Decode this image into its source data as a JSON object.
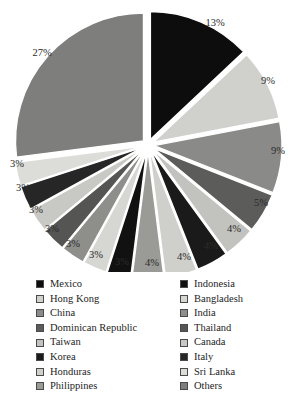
{
  "chart_data": {
    "type": "pie",
    "title": "",
    "subtitle": "",
    "xlabel": "",
    "ylabel": "",
    "grid": false,
    "legend_position": "bottom",
    "exploded": true,
    "start_angle_deg": -90,
    "center": {
      "x": 148,
      "y": 145
    },
    "radius": 128,
    "categories": [
      "Mexico",
      "Hong Kong",
      "China",
      "Dominican Republic",
      "Taiwan",
      "Korea",
      "Honduras",
      "Philippines",
      "Indonesia",
      "Bangladesh",
      "India",
      "Thailand",
      "Canada",
      "Italy",
      "Sri Lanka",
      "Others"
    ],
    "values": [
      13,
      9,
      9,
      5,
      4,
      4,
      4,
      4,
      3,
      3,
      3,
      3,
      3,
      3,
      3,
      27
    ],
    "value_labels": [
      "13%",
      "9%",
      "9%",
      "5%",
      "4%",
      "4%",
      "4%",
      "4%",
      "3%",
      "3%",
      "3%",
      "3%",
      "3%",
      "3%",
      "3%",
      "27%"
    ],
    "colors": [
      "#0d0d0d",
      "#d0d0cc",
      "#8a8a88",
      "#5c5c5a",
      "#c2c2be",
      "#1a1a1a",
      "#cfcfcb",
      "#9a9a97",
      "#111111",
      "#d6d6d2",
      "#8e8e8b",
      "#555553",
      "#c8c8c4",
      "#262626",
      "#dcdcd8",
      "#7e7e7c"
    ],
    "slices": [
      {
        "label": "Mexico",
        "value": 13,
        "value_label": "13%",
        "color": "#0d0d0d",
        "label_x": 215,
        "label_y": 22
      },
      {
        "label": "Hong Kong",
        "value": 9,
        "value_label": "9%",
        "color": "#d0d0cc",
        "label_x": 268,
        "label_y": 80
      },
      {
        "label": "China",
        "value": 9,
        "value_label": "9%",
        "color": "#8a8a88",
        "label_x": 278,
        "label_y": 150
      },
      {
        "label": "Dominican Republic",
        "value": 5,
        "value_label": "5%",
        "color": "#5c5c5a",
        "label_x": 261,
        "label_y": 202
      },
      {
        "label": "Taiwan",
        "value": 4,
        "value_label": "4%",
        "color": "#c2c2be",
        "label_x": 234,
        "label_y": 228
      },
      {
        "label": "Korea",
        "value": 4,
        "value_label": "4%",
        "color": "#1a1a1a",
        "label_x": 211,
        "label_y": 245
      },
      {
        "label": "Honduras",
        "value": 4,
        "value_label": "4%",
        "color": "#cfcfcb",
        "label_x": 184,
        "label_y": 256
      },
      {
        "label": "Philippines",
        "value": 4,
        "value_label": "4%",
        "color": "#9a9a97",
        "label_x": 152,
        "label_y": 262
      },
      {
        "label": "Indonesia",
        "value": 3,
        "value_label": "3%",
        "color": "#111111",
        "label_x": 122,
        "label_y": 261
      },
      {
        "label": "Bangladesh",
        "value": 3,
        "value_label": "3%",
        "color": "#d6d6d2",
        "label_x": 96,
        "label_y": 254
      },
      {
        "label": "India",
        "value": 3,
        "value_label": "3%",
        "color": "#8e8e8b",
        "label_x": 73,
        "label_y": 243
      },
      {
        "label": "Thailand",
        "value": 3,
        "value_label": "3%",
        "color": "#555553",
        "label_x": 52,
        "label_y": 228
      },
      {
        "label": "Canada",
        "value": 3,
        "value_label": "3%",
        "color": "#c8c8c4",
        "label_x": 36,
        "label_y": 209
      },
      {
        "label": "Italy",
        "value": 3,
        "value_label": "3%",
        "color": "#262626",
        "label_x": 23,
        "label_y": 187
      },
      {
        "label": "Sri Lanka",
        "value": 3,
        "value_label": "3%",
        "color": "#dcdcd8",
        "label_x": 17,
        "label_y": 163
      },
      {
        "label": "Others",
        "value": 27,
        "value_label": "27%",
        "color": "#7e7e7c",
        "label_x": 42,
        "label_y": 52
      }
    ]
  },
  "legend": {
    "left_column": [
      {
        "label": "Mexico",
        "color": "#0d0d0d"
      },
      {
        "label": "Hong Kong",
        "color": "#d0d0cc"
      },
      {
        "label": "China",
        "color": "#8a8a88"
      },
      {
        "label": "Dominican Republic",
        "color": "#5c5c5a"
      },
      {
        "label": "Taiwan",
        "color": "#c2c2be"
      },
      {
        "label": "Korea",
        "color": "#1a1a1a"
      },
      {
        "label": "Honduras",
        "color": "#cfcfcb"
      },
      {
        "label": "Philippines",
        "color": "#9a9a97"
      }
    ],
    "right_column": [
      {
        "label": "Indonesia",
        "color": "#111111"
      },
      {
        "label": "Bangladesh",
        "color": "#d6d6d2"
      },
      {
        "label": "India",
        "color": "#8e8e8b"
      },
      {
        "label": "Thailand",
        "color": "#555553"
      },
      {
        "label": "Canada",
        "color": "#c8c8c4"
      },
      {
        "label": "Italy",
        "color": "#262626"
      },
      {
        "label": "Sri Lanka",
        "color": "#dcdcd8"
      },
      {
        "label": "Others",
        "color": "#7e7e7c"
      }
    ]
  }
}
